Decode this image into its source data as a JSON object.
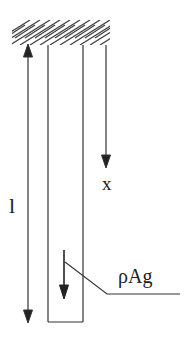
{
  "diagram": {
    "type": "hanging-bar-free-body",
    "support": {
      "label": "fixed-support",
      "style": "hatched"
    },
    "labels": {
      "length": "l",
      "axis": "x",
      "weight": "ρAg"
    },
    "colors": {
      "stroke": "#333333",
      "background": "#ffffff"
    }
  }
}
